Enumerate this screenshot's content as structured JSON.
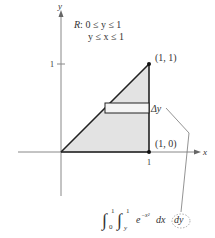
{
  "figure": {
    "region_label": "R: 0 ≤ y ≤ 1",
    "region_line1_prefix": "R",
    "region_line1": ": 0 ≤ y ≤ 1",
    "region_line2": "y ≤ x ≤ 1",
    "axis_x_label": "x",
    "axis_y_label": "y",
    "tick_x_1": "1",
    "tick_y_1": "1",
    "point_top_label": "(1, 1)",
    "point_bottom_label": "(1, 0)",
    "delta_label": "Δy",
    "integral": {
      "outer_lower": "0",
      "outer_upper": "1",
      "inner_lower": "y",
      "inner_upper": "1",
      "integrand_base": "e",
      "integrand_exp": "−x²",
      "dx": "dx",
      "dy": "dy"
    },
    "colors": {
      "region_fill": "#e3e3e3",
      "boundary": "#222222",
      "axis": "#888888",
      "leader": "#777777"
    }
  }
}
